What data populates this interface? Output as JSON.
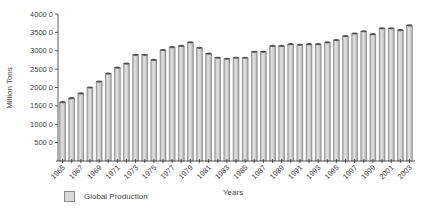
{
  "chart_data": {
    "type": "bar",
    "title": "",
    "xlabel": "Years",
    "ylabel": "Million Tons",
    "ylim": [
      0,
      4000
    ],
    "yticks": [
      500,
      1000,
      1500,
      2000,
      2500,
      3000,
      3500,
      4000
    ],
    "ytick_labels": [
      "500 0",
      "1000 0",
      "1500 0",
      "2000 0",
      "2500 0",
      "3000 0",
      "3500 0",
      "4000 0"
    ],
    "xtick_labels": [
      "1965",
      "1967",
      "1969",
      "1971",
      "1973",
      "1975",
      "1977",
      "1979",
      "1981",
      "1983",
      "1985",
      "1987",
      "1989",
      "1991",
      "1993",
      "1995",
      "1997",
      "1999",
      "2001",
      "2003"
    ],
    "grid": false,
    "legend_position": "bottom-left",
    "categories": [
      "1965",
      "1966",
      "1967",
      "1968",
      "1969",
      "1970",
      "1971",
      "1972",
      "1973",
      "1974",
      "1975",
      "1976",
      "1977",
      "1978",
      "1979",
      "1980",
      "1981",
      "1982",
      "1983",
      "1984",
      "1985",
      "1986",
      "1987",
      "1988",
      "1989",
      "1990",
      "1991",
      "1992",
      "1993",
      "1994",
      "1995",
      "1996",
      "1997",
      "1998",
      "1999",
      "2000",
      "2001",
      "2002",
      "2003"
    ],
    "series": [
      {
        "name": "Global Production",
        "color": "#d4d4d4",
        "values": [
          1600,
          1710,
          1840,
          2000,
          2160,
          2380,
          2540,
          2650,
          2890,
          2890,
          2750,
          3020,
          3100,
          3130,
          3230,
          3080,
          2920,
          2810,
          2780,
          2810,
          2810,
          2970,
          2970,
          3130,
          3130,
          3180,
          3160,
          3180,
          3180,
          3230,
          3290,
          3400,
          3470,
          3530,
          3450,
          3610,
          3610,
          3560,
          3690
        ]
      }
    ]
  },
  "legend": {
    "label": "Global Production"
  },
  "axes": {
    "xtitle": "Years",
    "ytitle": "Million Tons"
  }
}
